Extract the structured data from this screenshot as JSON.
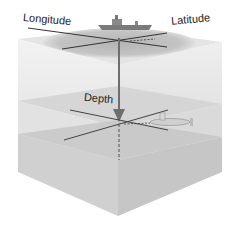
{
  "diagram": {
    "labels": {
      "longitude": "Longitude",
      "latitude": "Latitude",
      "depth": "Depth"
    },
    "elements": {
      "surface_vessel": "ship-icon",
      "underwater_vehicle": "submarine-icon",
      "depth_arrow": "down-arrow-icon"
    },
    "colors": {
      "cube_face_light": "#ececec",
      "cube_face_mid": "#dcdcdc",
      "cube_face_dark": "#c8c8c8",
      "surface_disc": "#bdbdbd",
      "axis_line": "#333333",
      "arrow": "#6e6e6e"
    }
  }
}
